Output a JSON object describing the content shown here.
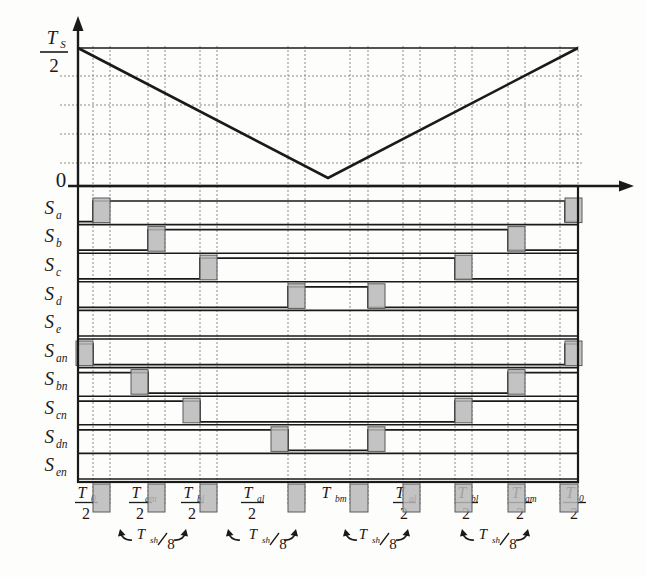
{
  "figure": {
    "type": "pwm-switching-timing-diagram",
    "axis": {
      "y_top_label_num": "T",
      "y_top_label_sub": "S",
      "y_top_label_den": "2",
      "y_zero_label": "0",
      "y_arrow": "up-arrow",
      "x_arrow": "right-arrow"
    },
    "carrier": {
      "name": "triangular-carrier",
      "shape": "down-up triangle",
      "peak_label": "T_S/2",
      "valley_label": "0",
      "points": [
        [
          78,
          48
        ],
        [
          328,
          178
        ],
        [
          578,
          48
        ]
      ],
      "horizontal_gridlines_y": [
        76,
        105,
        134,
        163
      ],
      "vertical_gridlines_x": [
        93,
        110,
        148,
        165,
        200,
        217,
        288,
        305,
        350,
        368,
        403,
        420,
        455,
        472,
        508,
        525,
        560,
        578
      ]
    },
    "signals": [
      {
        "id": "Sa",
        "label_main": "S",
        "label_sub": "a",
        "rise": 93,
        "fall": 565,
        "row": 0
      },
      {
        "id": "Sb",
        "label_main": "S",
        "label_sub": "b",
        "rise": 148,
        "fall": 508,
        "row": 1
      },
      {
        "id": "Sc",
        "label_main": "S",
        "label_sub": "c",
        "rise": 200,
        "fall": 455,
        "row": 2
      },
      {
        "id": "Sd",
        "label_main": "S",
        "label_sub": "d",
        "rise": 288,
        "fall": 368,
        "row": 3
      },
      {
        "id": "Se",
        "label_main": "S",
        "label_sub": "e",
        "rise": null,
        "fall": null,
        "row": 4
      },
      {
        "id": "San",
        "label_main": "S",
        "label_sub": "an",
        "rise": 78,
        "fall": 93,
        "row": 5,
        "complement": true,
        "rise2": 565,
        "fall2": 578
      },
      {
        "id": "Sbn",
        "label_main": "S",
        "label_sub": "bn",
        "rise": 132,
        "fall": 148,
        "row": 6,
        "complement": true,
        "rise2": 508,
        "fall2": 525
      },
      {
        "id": "Scn",
        "label_main": "S",
        "label_sub": "cn",
        "rise": 183,
        "fall": 200,
        "row": 7,
        "complement": true,
        "rise2": 455,
        "fall2": 472
      },
      {
        "id": "Sdn",
        "label_main": "S",
        "label_sub": "dn",
        "rise": 272,
        "fall": 288,
        "row": 8,
        "complement": true,
        "rise2": 368,
        "fall2": 385
      },
      {
        "id": "Sen",
        "label_main": "S",
        "label_sub": "en",
        "rise": null,
        "fall": null,
        "row": 9
      }
    ],
    "interval_labels": [
      {
        "num": "T",
        "sub": "0",
        "den": "2",
        "x": 86,
        "stacked": true
      },
      {
        "num": "T",
        "sub": "am",
        "den": "2",
        "x": 140,
        "stacked": true
      },
      {
        "num": "T",
        "sub": "bl",
        "den": "2",
        "x": 192,
        "stacked": true
      },
      {
        "num": "T",
        "sub": "al",
        "den": "2",
        "x": 252,
        "stacked": true
      },
      {
        "num": "T",
        "sub": "bm",
        "den": "",
        "x": 330,
        "stacked": false
      },
      {
        "num": "T",
        "sub": "al",
        "den": "2",
        "x": 404,
        "stacked": true
      },
      {
        "num": "T",
        "sub": "bl",
        "den": "2",
        "x": 466,
        "stacked": true
      },
      {
        "num": "T",
        "sub": "am",
        "den": "2",
        "x": 520,
        "stacked": true
      },
      {
        "num": "T",
        "sub": "0",
        "den": "2",
        "x": 574,
        "stacked": true
      }
    ],
    "deadtime_markers": [
      {
        "num": "T",
        "sub": "sh",
        "den": "8",
        "x": 150,
        "arrow_left_x": 120,
        "arrow_right_x": 186
      },
      {
        "num": "T",
        "sub": "sh",
        "den": "8",
        "x": 262,
        "arrow_left_x": 228,
        "arrow_right_x": 296
      },
      {
        "num": "T",
        "sub": "sh",
        "den": "8",
        "x": 372,
        "arrow_left_x": 345,
        "arrow_right_x": 408
      },
      {
        "num": "T",
        "sub": "sh",
        "den": "8",
        "x": 492,
        "arrow_left_x": 462,
        "arrow_right_x": 528
      }
    ],
    "deadtime_bands": [
      {
        "x": 93,
        "w": 17
      },
      {
        "x": 148,
        "w": 17
      },
      {
        "x": 200,
        "w": 17
      },
      {
        "x": 288,
        "w": 17
      },
      {
        "x": 350,
        "w": 18
      },
      {
        "x": 403,
        "w": 17
      },
      {
        "x": 455,
        "w": 17
      },
      {
        "x": 508,
        "w": 17
      },
      {
        "x": 560,
        "w": 18
      }
    ],
    "colors": {
      "ink": "#1a1a1a",
      "grid": "#8a8a8a",
      "band_fill": "#b9b9b9",
      "band_stroke": "#5a5a5a",
      "paper": "#fdfdfc"
    }
  }
}
